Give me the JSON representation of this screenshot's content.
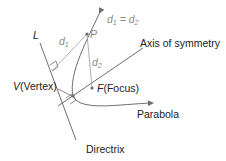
{
  "diagram": {
    "type": "parabola-definition",
    "labels": {
      "directrix_line": "L",
      "d1": "d",
      "d1_sub": "1",
      "d2": "d",
      "d2_sub": "2",
      "point": "P",
      "equation_left": "d",
      "equation_left_sub": "1",
      "equation_eq": " = ",
      "equation_right": "d",
      "equation_right_sub": "2",
      "axis": "Axis of symmetry",
      "vertex_letter": "V",
      "vertex_text": "(Vertex)",
      "focus_letter": "F",
      "focus_text": "(Focus)",
      "parabola": "Parabola",
      "directrix": "Directrix"
    },
    "colors": {
      "line": "#6e6e6e",
      "light_line": "#9a9a9a",
      "text": "#222222",
      "gray_text": "#8a8a8a"
    }
  }
}
